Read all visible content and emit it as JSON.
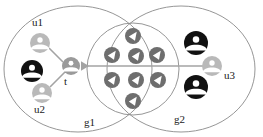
{
  "diagram": {
    "type": "venn-social-graph",
    "title": "",
    "colors": {
      "ellipse_stroke": "#8a8a8a",
      "inner_circle_stroke": "#8a8a8a",
      "node_light": "#b9b9b9",
      "node_dark": "#111111",
      "node_mid": "#9a9a9a",
      "badge_fill": "#6e6e6e",
      "badge_glyph": "#ffffff",
      "edge": "#a3a3a3",
      "label_text": "#1a1a1a",
      "background": "#ffffff"
    },
    "groups": [
      {
        "id": "g1",
        "label": "g1",
        "cx": 78,
        "cy": 69,
        "rx": 74,
        "ry": 63
      },
      {
        "id": "g2",
        "label": "g2",
        "cx": 181,
        "cy": 69,
        "rx": 74,
        "ry": 63
      }
    ],
    "inner_circle": {
      "id": "overlap",
      "label": "",
      "cx": 133,
      "cy": 69,
      "r": 46
    },
    "nodes": [
      {
        "id": "u1",
        "label": "u1",
        "kind": "person-icon",
        "shade": "light",
        "cx": 40,
        "cy": 43,
        "r": 10,
        "label_x": 40,
        "label_y": 25,
        "label_anchor": "middle"
      },
      {
        "id": "black1",
        "label": "",
        "kind": "person-icon",
        "shade": "dark",
        "cx": 32,
        "cy": 71,
        "r": 11,
        "label_x": 0,
        "label_y": 0,
        "label_anchor": "middle"
      },
      {
        "id": "u2",
        "label": "u2",
        "kind": "person-icon",
        "shade": "light",
        "cx": 42,
        "cy": 93,
        "r": 10,
        "label_x": 42,
        "label_y": 112,
        "label_anchor": "middle"
      },
      {
        "id": "t",
        "label": "t",
        "kind": "person-icon",
        "shade": "mid",
        "cx": 71,
        "cy": 66,
        "r": 9,
        "label_x": 72,
        "label_y": 84,
        "label_anchor": "middle"
      },
      {
        "id": "black2",
        "label": "",
        "kind": "person-icon",
        "shade": "dark",
        "cx": 196,
        "cy": 43,
        "r": 12,
        "label_x": 0,
        "label_y": 0,
        "label_anchor": "middle"
      },
      {
        "id": "u3",
        "label": "u3",
        "kind": "person-icon",
        "shade": "light",
        "cx": 212,
        "cy": 66,
        "r": 10,
        "label_x": 224,
        "label_y": 78,
        "label_anchor": "start"
      },
      {
        "id": "black3",
        "label": "",
        "kind": "person-icon",
        "shade": "dark",
        "cx": 196,
        "cy": 87,
        "r": 12,
        "label_x": 0,
        "label_y": 0,
        "label_anchor": "middle"
      }
    ],
    "badges": [
      {
        "id": "b1",
        "cx": 133,
        "cy": 36,
        "r": 8,
        "glyph": "check-badge-icon"
      },
      {
        "id": "b2",
        "cx": 112,
        "cy": 55,
        "r": 8,
        "glyph": "check-badge-icon"
      },
      {
        "id": "b3",
        "cx": 136,
        "cy": 56,
        "r": 8,
        "glyph": "check-badge-icon"
      },
      {
        "id": "b4",
        "cx": 157,
        "cy": 55,
        "r": 8,
        "glyph": "check-badge-icon"
      },
      {
        "id": "b5",
        "cx": 112,
        "cy": 80,
        "r": 8,
        "glyph": "check-badge-icon"
      },
      {
        "id": "b6",
        "cx": 136,
        "cy": 80,
        "r": 8,
        "glyph": "check-badge-icon"
      },
      {
        "id": "b7",
        "cx": 158,
        "cy": 80,
        "r": 8,
        "glyph": "check-badge-icon"
      },
      {
        "id": "b8",
        "cx": 133,
        "cy": 101,
        "r": 8,
        "glyph": "check-badge-icon"
      }
    ],
    "edges": [
      {
        "id": "e-u1-t",
        "from": "u1",
        "to": "t",
        "x1": 49,
        "y1": 48,
        "x2": 63,
        "y2": 62,
        "arrow": "none"
      },
      {
        "id": "e-u2-t",
        "from": "u2",
        "to": "t",
        "x1": 50,
        "y1": 87,
        "x2": 65,
        "y2": 72,
        "arrow": "none"
      },
      {
        "id": "e-u3-t",
        "from": "u3",
        "to": "t",
        "x1": 203,
        "y1": 66,
        "x2": 81,
        "y2": 66,
        "arrow": "left"
      }
    ]
  }
}
